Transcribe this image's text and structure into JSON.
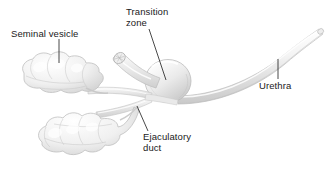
{
  "figure": {
    "type": "anatomical-illustration",
    "background_color": "#ffffff",
    "line_color": "#1a1a1a",
    "tissue_fill": "#f2f2f2",
    "tissue_shadow": "#d8d8d8",
    "tissue_outline": "#bdbdbd"
  },
  "labels": {
    "seminal_vesicle": "Seminal vesicle",
    "transition_zone": "Transition\nzone",
    "urethra": "Urethra",
    "ejaculatory_duct": "Ejaculatory\nduct"
  },
  "structures": [
    {
      "name": "upper-seminal-vesicle",
      "description": "lobulated sac cluster, upper left"
    },
    {
      "name": "lower-seminal-vesicle",
      "description": "lobulated sac cluster, lower left"
    },
    {
      "name": "transition-zone",
      "description": "rounded central prostate sphere"
    },
    {
      "name": "cut-duct-stump",
      "description": "cut tubular stump above prostate"
    },
    {
      "name": "ejaculatory-duct",
      "description": "duct running to prostate base"
    },
    {
      "name": "urethra",
      "description": "long curved tube sweeping to upper right"
    }
  ],
  "leader_lines": [
    {
      "name": "leader-seminal-vesicle",
      "x1": 59,
      "y1": 39,
      "x2": 59,
      "y2": 63
    },
    {
      "name": "leader-transition-zone",
      "x1": 149,
      "y1": 29,
      "x2": 166,
      "y2": 80
    },
    {
      "name": "leader-urethra",
      "x1": 278,
      "y1": 59,
      "x2": 278,
      "y2": 79
    },
    {
      "name": "leader-ejaculatory-duct",
      "x1": 137,
      "y1": 106,
      "x2": 148,
      "y2": 131
    }
  ]
}
